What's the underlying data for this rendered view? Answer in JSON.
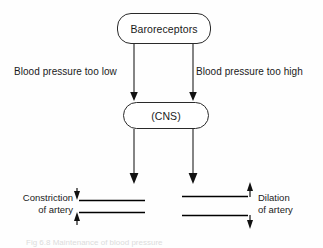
{
  "diagram": {
    "nodes": [
      {
        "id": "baroreceptors",
        "label": "Baroreceptors",
        "shape": "rounded-rect"
      },
      {
        "id": "cns",
        "label": "(CNS)",
        "shape": "rounded-rect"
      }
    ],
    "edge_labels": {
      "left": "Blood pressure too low",
      "right": "Blood pressure too high"
    },
    "outcomes": {
      "left": {
        "line1": "Constriction",
        "line2": "of artery",
        "effect": "narrowing",
        "top_arrow": "down",
        "bottom_arrow": "up"
      },
      "right": {
        "line1": "Dilation",
        "line2": "of artery",
        "effect": "widening",
        "top_arrow": "up",
        "bottom_arrow": "down"
      }
    },
    "caption": "Fig 6.8 Maintenance of blood pressure",
    "colors": {
      "stroke": "#1f1f1f",
      "text": "#1a1a1a",
      "background": "#fefefe",
      "artery": "#000000"
    }
  }
}
